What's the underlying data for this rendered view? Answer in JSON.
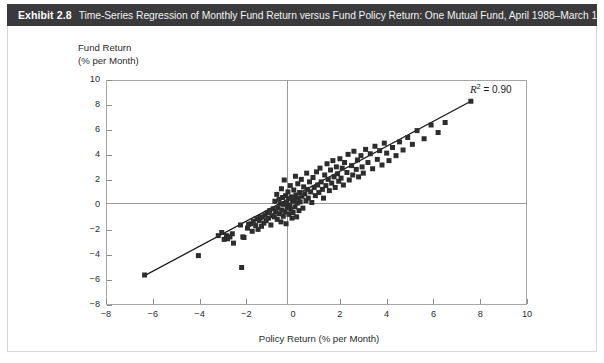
{
  "exhibit": {
    "number": "Exhibit 2.8",
    "caption": "Time-Series Regression of Monthly Fund Return versus Fund Policy Return: One Mutual Fund, April 1988–March 1998"
  },
  "annotations": {
    "r2_label": "R",
    "r2_exponent": "2",
    "r2_value": "= 0.90"
  },
  "colors": {
    "title_bar": "#3a3a3c",
    "title_text": "#ffffff",
    "marker": "#2d2d2d",
    "axis": "#a6a6a6",
    "zero_axis": "#9a9a9a",
    "regression_line": "#1a1a1a",
    "page_border": "#d8d8d8",
    "background": "#ffffff"
  },
  "chart_data": {
    "type": "scatter",
    "title": "Time-Series Regression of Monthly Fund Return versus Fund Policy Return: One Mutual Fund, April 1988–March 1998",
    "xlabel": "Policy Return (% per Month)",
    "ylabel_line1": "Fund Return",
    "ylabel_line2": "(% per Month)",
    "xlim": [
      -8,
      10
    ],
    "ylim": [
      -8,
      10
    ],
    "xticks": [
      -8,
      -6,
      -4,
      -2,
      0,
      2,
      4,
      6,
      8,
      10
    ],
    "yticks": [
      -8,
      -6,
      -4,
      -2,
      0,
      2,
      4,
      6,
      8,
      10
    ],
    "xticklabels": [
      "−8",
      "−6",
      "−4",
      "−2",
      "0",
      "2",
      "4",
      "6",
      "8",
      "10"
    ],
    "yticklabels": [
      "−8",
      "−6",
      "−4",
      "−2",
      "0",
      "2",
      "4",
      "6",
      "8",
      "10"
    ],
    "grid": false,
    "legend": null,
    "marker_shape": "square",
    "marker_size": 5,
    "r_squared": 0.9,
    "annotation": "R² = 0.90",
    "regression_line": {
      "x0": -6.35,
      "y0": -5.65,
      "x1": 7.6,
      "y1": 8.3
    },
    "points": [
      [
        -6.35,
        -5.6
      ],
      [
        -4.05,
        -4.05
      ],
      [
        -3.2,
        -2.45
      ],
      [
        -3.05,
        -2.2
      ],
      [
        -2.95,
        -2.75
      ],
      [
        -2.85,
        -2.45
      ],
      [
        -2.8,
        -2.7
      ],
      [
        -2.7,
        -2.55
      ],
      [
        -2.6,
        -2.3
      ],
      [
        -2.55,
        -3.05
      ],
      [
        -2.25,
        -1.6
      ],
      [
        -2.2,
        -5.0
      ],
      [
        -2.15,
        -2.55
      ],
      [
        -2.1,
        -2.6
      ],
      [
        -1.95,
        -1.85
      ],
      [
        -1.9,
        -1.55
      ],
      [
        -1.8,
        -1.5
      ],
      [
        -1.75,
        -2.1
      ],
      [
        -1.7,
        -1.3
      ],
      [
        -1.6,
        -1.65
      ],
      [
        -1.55,
        -1.1
      ],
      [
        -1.5,
        -1.95
      ],
      [
        -1.45,
        -1.25
      ],
      [
        -1.4,
        -1.0
      ],
      [
        -1.35,
        -1.7
      ],
      [
        -1.3,
        -0.95
      ],
      [
        -1.25,
        -1.45
      ],
      [
        -1.2,
        -0.8
      ],
      [
        -1.15,
        -1.25
      ],
      [
        -1.1,
        -0.6
      ],
      [
        -1.05,
        -1.05
      ],
      [
        -1.0,
        -0.45
      ],
      [
        -0.95,
        -1.6
      ],
      [
        -0.9,
        -0.85
      ],
      [
        -0.85,
        -0.3
      ],
      [
        -0.8,
        -0.95
      ],
      [
        -0.78,
        0.3
      ],
      [
        -0.75,
        -0.55
      ],
      [
        -0.7,
        0.85
      ],
      [
        -0.68,
        -1.15
      ],
      [
        -0.65,
        -0.25
      ],
      [
        -0.6,
        0.45
      ],
      [
        -0.58,
        -0.7
      ],
      [
        -0.55,
        0.1
      ],
      [
        -0.52,
        -1.35
      ],
      [
        -0.5,
        1.3
      ],
      [
        -0.48,
        -0.4
      ],
      [
        -0.45,
        0.6
      ],
      [
        -0.42,
        -0.9
      ],
      [
        -0.4,
        0.05
      ],
      [
        -0.38,
        2.0
      ],
      [
        -0.35,
        -0.55
      ],
      [
        -0.32,
        0.75
      ],
      [
        -0.3,
        -1.5
      ],
      [
        -0.28,
        0.2
      ],
      [
        -0.25,
        -0.2
      ],
      [
        -0.22,
        1.05
      ],
      [
        -0.2,
        0.5
      ],
      [
        -0.18,
        -0.75
      ],
      [
        -0.15,
        0.0
      ],
      [
        -0.12,
        1.55
      ],
      [
        -0.1,
        -0.35
      ],
      [
        -0.08,
        0.65
      ],
      [
        -0.05,
        -1.05
      ],
      [
        -0.02,
        0.3
      ],
      [
        0.0,
        -0.6
      ],
      [
        0.03,
        1.2
      ],
      [
        0.05,
        0.45
      ],
      [
        0.08,
        -0.15
      ],
      [
        0.1,
        2.3
      ],
      [
        0.12,
        0.8
      ],
      [
        0.15,
        -0.95
      ],
      [
        0.18,
        0.15
      ],
      [
        0.2,
        1.7
      ],
      [
        0.22,
        0.55
      ],
      [
        0.25,
        -0.45
      ],
      [
        0.28,
        1.0
      ],
      [
        0.3,
        0.25
      ],
      [
        0.35,
        2.05
      ],
      [
        0.38,
        0.7
      ],
      [
        0.42,
        -0.25
      ],
      [
        0.45,
        1.45
      ],
      [
        0.5,
        0.9
      ],
      [
        0.55,
        0.35
      ],
      [
        0.58,
        2.55
      ],
      [
        0.62,
        1.25
      ],
      [
        0.65,
        0.55
      ],
      [
        0.7,
        1.85
      ],
      [
        0.75,
        1.05
      ],
      [
        0.8,
        0.2
      ],
      [
        0.85,
        2.2
      ],
      [
        0.9,
        1.4
      ],
      [
        0.95,
        0.75
      ],
      [
        1.0,
        2.65
      ],
      [
        1.05,
        1.6
      ],
      [
        1.1,
        1.0
      ],
      [
        1.15,
        2.95
      ],
      [
        1.2,
        1.85
      ],
      [
        1.25,
        1.25
      ],
      [
        1.3,
        0.55
      ],
      [
        1.35,
        2.4
      ],
      [
        1.4,
        1.55
      ],
      [
        1.45,
        3.3
      ],
      [
        1.5,
        2.05
      ],
      [
        1.55,
        1.15
      ],
      [
        1.6,
        2.8
      ],
      [
        1.65,
        1.75
      ],
      [
        1.7,
        3.55
      ],
      [
        1.75,
        2.25
      ],
      [
        1.8,
        1.4
      ],
      [
        1.85,
        3.05
      ],
      [
        1.9,
        2.5
      ],
      [
        1.95,
        1.9
      ],
      [
        2.0,
        3.7
      ],
      [
        2.05,
        2.15
      ],
      [
        2.1,
        2.95
      ],
      [
        2.15,
        1.6
      ],
      [
        2.2,
        3.4
      ],
      [
        2.3,
        2.6
      ],
      [
        2.35,
        4.05
      ],
      [
        2.4,
        2.0
      ],
      [
        2.5,
        3.15
      ],
      [
        2.55,
        2.4
      ],
      [
        2.6,
        4.3
      ],
      [
        2.7,
        2.85
      ],
      [
        2.75,
        3.6
      ],
      [
        2.8,
        2.25
      ],
      [
        2.9,
        3.95
      ],
      [
        2.95,
        3.05
      ],
      [
        3.0,
        2.55
      ],
      [
        3.1,
        4.45
      ],
      [
        3.2,
        3.4
      ],
      [
        3.3,
        4.1
      ],
      [
        3.4,
        2.9
      ],
      [
        3.5,
        4.7
      ],
      [
        3.6,
        3.65
      ],
      [
        3.7,
        4.35
      ],
      [
        3.8,
        3.2
      ],
      [
        3.9,
        4.95
      ],
      [
        4.0,
        4.15
      ],
      [
        4.1,
        3.55
      ],
      [
        4.25,
        4.6
      ],
      [
        4.4,
        3.95
      ],
      [
        4.55,
        5.05
      ],
      [
        4.7,
        4.4
      ],
      [
        4.9,
        5.4
      ],
      [
        5.1,
        4.85
      ],
      [
        5.3,
        5.95
      ],
      [
        5.6,
        5.3
      ],
      [
        5.9,
        6.4
      ],
      [
        6.2,
        5.8
      ],
      [
        6.5,
        6.6
      ],
      [
        7.6,
        8.3
      ]
    ]
  }
}
